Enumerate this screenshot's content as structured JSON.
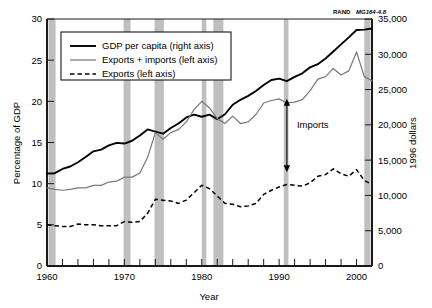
{
  "source_note": {
    "brand": "RAND",
    "document_id": "MG164-4.8"
  },
  "chart_data": {
    "type": "line",
    "title": "",
    "xlabel": "Year",
    "ylabel": "Percentage of GDP",
    "y2label": "1996 dollars",
    "xlim": [
      1960,
      2002
    ],
    "ylim": [
      0,
      30
    ],
    "y2lim": [
      0,
      35000
    ],
    "grid": false,
    "legend_position": "upper-left-inside",
    "x_tick_labels": [
      "1960",
      "1970",
      "1980",
      "1990",
      "2000"
    ],
    "x_tick_values": [
      1960,
      1970,
      1980,
      1990,
      2000
    ],
    "x_minor_tick_step": 2,
    "y_tick_labels": [
      "0",
      "5",
      "10",
      "15",
      "20",
      "25",
      "30"
    ],
    "y_tick_values": [
      0,
      5,
      10,
      15,
      20,
      25,
      30
    ],
    "y2_tick_labels": [
      "0",
      "5,000",
      "10,000",
      "15,000",
      "20,000",
      "25,000",
      "30,000",
      "35,000"
    ],
    "y2_tick_values": [
      0,
      5000,
      10000,
      15000,
      20000,
      25000,
      30000,
      35000
    ],
    "annotations": [
      {
        "name": "imports-gap",
        "label": "Imports",
        "x": 1991,
        "y_top": 20.3,
        "y_bottom": 11.4,
        "style": "double-headed-arrow"
      }
    ],
    "shaded_regions": {
      "name": "recessions",
      "color": "#bfbfbf",
      "spans": [
        [
          1960.2,
          1961.1
        ],
        [
          1969.9,
          1970.8
        ],
        [
          1973.9,
          1975.1
        ],
        [
          1980.0,
          1980.6
        ],
        [
          1981.5,
          1982.8
        ],
        [
          1990.6,
          1991.2
        ],
        [
          2001.0,
          2001.8
        ]
      ]
    },
    "x": [
      1960,
      1961,
      1962,
      1963,
      1964,
      1965,
      1966,
      1967,
      1968,
      1969,
      1970,
      1971,
      1972,
      1973,
      1974,
      1975,
      1976,
      1977,
      1978,
      1979,
      1980,
      1981,
      1982,
      1983,
      1984,
      1985,
      1986,
      1987,
      1988,
      1989,
      1990,
      1991,
      1992,
      1993,
      1994,
      1995,
      1996,
      1997,
      1998,
      1999,
      2000,
      2001,
      2002
    ],
    "series": [
      {
        "name": "GDP per capita (right axis)",
        "axis": "right",
        "units": "1996 dollars",
        "style": "solid",
        "color": "#000000",
        "values": [
          13100,
          13150,
          13750,
          14100,
          14700,
          15450,
          16250,
          16500,
          17100,
          17450,
          17350,
          17750,
          18500,
          19350,
          19050,
          18750,
          19550,
          20200,
          21050,
          21450,
          21150,
          21450,
          20800,
          21500,
          22850,
          23550,
          24100,
          24800,
          25650,
          26350,
          26550,
          26200,
          26800,
          27300,
          28150,
          28600,
          29400,
          30400,
          31400,
          32400,
          33450,
          33500,
          33650
        ]
      },
      {
        "name": "Exports + imports (left axis)",
        "axis": "left",
        "units": "Percentage of GDP",
        "style": "solid",
        "color": "#7a7a7a",
        "values": [
          9.5,
          9.3,
          9.2,
          9.3,
          9.5,
          9.5,
          9.8,
          9.8,
          10.2,
          10.3,
          10.8,
          10.8,
          11.3,
          13.2,
          16.2,
          15.4,
          16.2,
          16.6,
          17.5,
          19.0,
          20.0,
          19.2,
          17.9,
          17.3,
          18.2,
          17.3,
          17.5,
          18.4,
          19.8,
          20.1,
          20.3,
          19.8,
          19.9,
          20.2,
          21.3,
          22.7,
          23.0,
          24.0,
          23.2,
          23.7,
          26.0,
          23.0,
          22.5
        ]
      },
      {
        "name": "Exports (left axis)",
        "axis": "left",
        "units": "Percentage of GDP",
        "style": "dashed",
        "color": "#000000",
        "values": [
          5.0,
          4.9,
          4.8,
          4.8,
          5.1,
          5.0,
          5.0,
          4.9,
          4.9,
          4.9,
          5.4,
          5.3,
          5.4,
          6.4,
          8.1,
          8.0,
          7.9,
          7.6,
          8.0,
          8.9,
          9.8,
          9.4,
          8.5,
          7.6,
          7.5,
          7.2,
          7.3,
          7.6,
          8.7,
          9.2,
          9.6,
          9.9,
          9.8,
          9.7,
          10.1,
          10.9,
          11.1,
          11.8,
          11.2,
          10.9,
          11.7,
          10.4,
          9.9
        ]
      }
    ],
    "legend_entries": [
      {
        "label": "GDP per capita (right axis)",
        "style": "solid",
        "color": "#000000"
      },
      {
        "label": "Exports + imports (left axis)",
        "style": "solid",
        "color": "#7a7a7a"
      },
      {
        "label": "Exports (left axis)",
        "style": "dashed",
        "color": "#000000"
      }
    ]
  }
}
